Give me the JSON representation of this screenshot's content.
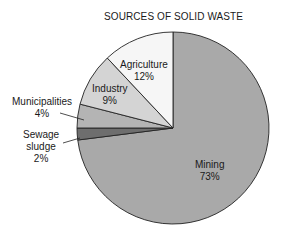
{
  "chart_data": {
    "type": "pie",
    "title": "SOURCES OF SOLID WASTE",
    "slices": [
      {
        "label": "Mining",
        "value": 73,
        "display": "73%",
        "color": "#a9a9a9"
      },
      {
        "label": "Sewage sludge",
        "value": 2,
        "display": "2%",
        "color": "#6e6e6e"
      },
      {
        "label": "Municipalities",
        "value": 4,
        "display": "4%",
        "color": "#b4b4b4"
      },
      {
        "label": "Industry",
        "value": 9,
        "display": "9%",
        "color": "#d4d4d4"
      },
      {
        "label": "Agriculture",
        "value": 12,
        "display": "12%",
        "color": "#f6f6f6"
      }
    ],
    "legend": "none (labels on/beside slices)"
  },
  "labels": {
    "mining": {
      "name": "Mining",
      "pct": "73%"
    },
    "sewage": {
      "name1": "Sewage",
      "name2": "sludge",
      "pct": "2%"
    },
    "municipalities": {
      "name": "Municipalities",
      "pct": "4%"
    },
    "industry": {
      "name": "Industry",
      "pct": "9%"
    },
    "agriculture": {
      "name": "Agriculture",
      "pct": "12%"
    }
  }
}
